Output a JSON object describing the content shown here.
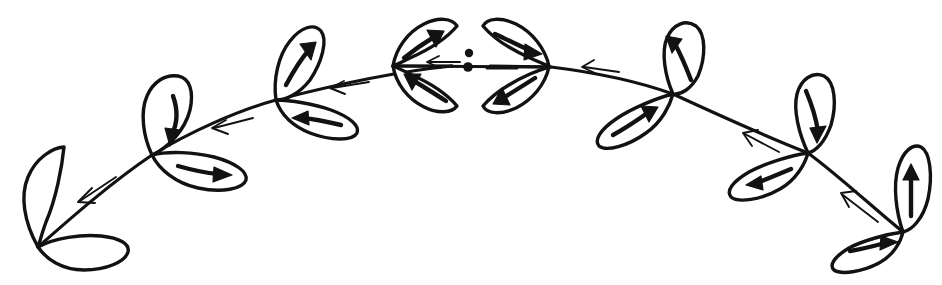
{
  "figure": {
    "kind": "sketch-diagram",
    "canvas": {
      "width": 942,
      "height": 285
    },
    "ink_color": "#121212",
    "background_color": "#ffffff"
  },
  "arch": {
    "description": "Symmetric arc (branch / stem) spanning the full width, apex at center",
    "left_tip": {
      "x": 38,
      "y": 247
    },
    "apex": {
      "x": 471,
      "y": 66
    },
    "right_tip": {
      "x": 903,
      "y": 232
    },
    "nodes": [
      {
        "id": "node-left-tip",
        "x": 38,
        "y": 247,
        "label": "left terminal node"
      },
      {
        "id": "node-left-outer",
        "x": 152,
        "y": 155,
        "label": "left outer node"
      },
      {
        "id": "node-left-inner",
        "x": 276,
        "y": 100,
        "label": "left inner node"
      },
      {
        "id": "node-center",
        "x": 471,
        "y": 66,
        "label": "center rosette node"
      },
      {
        "id": "node-right-inner",
        "x": 673,
        "y": 94,
        "label": "right inner node"
      },
      {
        "id": "node-right-outer",
        "x": 808,
        "y": 153,
        "label": "right outer node"
      },
      {
        "id": "node-right-tip",
        "x": 903,
        "y": 232,
        "label": "right terminal node"
      }
    ]
  },
  "stem_arrows": [
    {
      "id": "stem-arrow-1",
      "segment": "left-tip to left-outer",
      "direction": "down-left",
      "style": "thin-open"
    },
    {
      "id": "stem-arrow-2",
      "segment": "left-outer to left-inner",
      "direction": "left",
      "style": "thin-open"
    },
    {
      "id": "stem-arrow-3",
      "segment": "left-inner to center",
      "direction": "left",
      "style": "thin-open"
    },
    {
      "id": "stem-arrow-4",
      "segment": "center to right-inner",
      "direction": "left",
      "style": "thin-open"
    },
    {
      "id": "stem-arrow-5",
      "segment": "right-inner to right-outer",
      "direction": "up-left",
      "style": "thin-open"
    },
    {
      "id": "stem-arrow-6",
      "segment": "right-outer to right-tip",
      "direction": "up-left",
      "style": "thin-open"
    }
  ],
  "leaves": [
    {
      "id": "leaf-l1-upper",
      "node": "node-left-tip",
      "side": "upper",
      "arrow_direction": "none",
      "has_arrow": false
    },
    {
      "id": "leaf-l1-lower",
      "node": "node-left-tip",
      "side": "lower",
      "arrow_direction": "none",
      "has_arrow": false
    },
    {
      "id": "leaf-l2-upper",
      "node": "node-left-outer",
      "side": "upper",
      "arrow_direction": "down",
      "has_arrow": true
    },
    {
      "id": "leaf-l2-lower",
      "node": "node-left-outer",
      "side": "lower",
      "arrow_direction": "right",
      "has_arrow": true
    },
    {
      "id": "leaf-l3-upper",
      "node": "node-left-inner",
      "side": "upper",
      "arrow_direction": "up-right",
      "has_arrow": true
    },
    {
      "id": "leaf-l3-lower",
      "node": "node-left-inner",
      "side": "lower",
      "arrow_direction": "left",
      "has_arrow": true
    },
    {
      "id": "leaf-c-upper-left",
      "node": "node-center",
      "side": "upper-left",
      "arrow_direction": "up-right",
      "has_arrow": true
    },
    {
      "id": "leaf-c-upper-right",
      "node": "node-center",
      "side": "upper-right",
      "arrow_direction": "right",
      "has_arrow": true
    },
    {
      "id": "leaf-c-lower-left",
      "node": "node-center",
      "side": "lower-left",
      "arrow_direction": "up-left",
      "has_arrow": true
    },
    {
      "id": "leaf-c-lower-right",
      "node": "node-center",
      "side": "lower-right",
      "arrow_direction": "down-left",
      "has_arrow": true
    },
    {
      "id": "leaf-r3-upper",
      "node": "node-right-inner",
      "side": "upper",
      "arrow_direction": "up-left",
      "has_arrow": true
    },
    {
      "id": "leaf-r3-lower",
      "node": "node-right-inner",
      "side": "lower",
      "arrow_direction": "up-right",
      "has_arrow": true
    },
    {
      "id": "leaf-r2-upper",
      "node": "node-right-outer",
      "side": "upper",
      "arrow_direction": "down",
      "has_arrow": true
    },
    {
      "id": "leaf-r2-lower",
      "node": "node-right-outer",
      "side": "lower",
      "arrow_direction": "left",
      "has_arrow": true
    },
    {
      "id": "leaf-r1-upper",
      "node": "node-right-tip",
      "side": "upper",
      "arrow_direction": "up",
      "has_arrow": true
    },
    {
      "id": "leaf-r1-lower",
      "node": "node-right-tip",
      "side": "lower",
      "arrow_direction": "right",
      "has_arrow": true
    }
  ],
  "center_rosette": {
    "description": "Four-petal lens/rosette at the apex with a horizontal axis line, two dots and a short dash",
    "center": {
      "x": 471,
      "y": 66
    },
    "half_width": 78,
    "half_height": 48,
    "petal_count": 4,
    "dots": [
      {
        "id": "center-dot-upper",
        "x": 469,
        "y": 53,
        "r": 4.2
      },
      {
        "id": "center-dot-lower",
        "x": 468,
        "y": 67,
        "r": 4.8
      }
    ],
    "dash": {
      "x1": 487,
      "y1": 68,
      "x2": 517,
      "y2": 68
    },
    "axis_line": {
      "x1": 393,
      "y1": 66,
      "x2": 549,
      "y2": 67
    }
  }
}
